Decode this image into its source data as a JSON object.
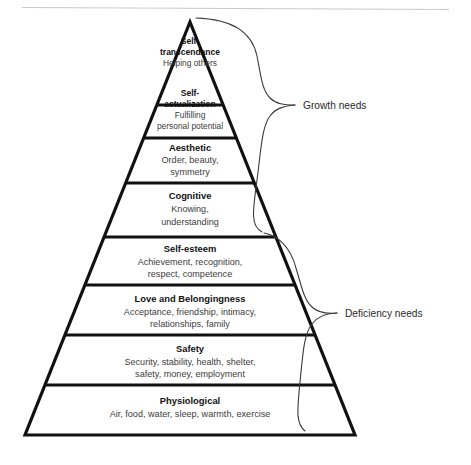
{
  "diagram": {
    "type": "pyramid-hierarchy",
    "background_color": "#ffffff",
    "line_color": "#111111",
    "brace_color": "#3a3a3a",
    "rule_color": "#c9c9c9",
    "tiers": [
      {
        "id": "self-transcendance",
        "title": "Self-",
        "title2": "transcendance",
        "description_line1": "Helping others",
        "description_line2": "",
        "group": "growth"
      },
      {
        "id": "self-actualization",
        "title": "Self-",
        "title2": "actualization",
        "description_line1": "Fulfilling",
        "description_line2": "personal potential",
        "group": "growth"
      },
      {
        "id": "aesthetic",
        "title": "Aesthetic",
        "title2": "",
        "description_line1": "Order, beauty,",
        "description_line2": "symmetry",
        "group": "growth"
      },
      {
        "id": "cognitive",
        "title": "Cognitive",
        "title2": "",
        "description_line1": "Knowing,",
        "description_line2": "understanding",
        "group": "growth"
      },
      {
        "id": "self-esteem",
        "title": "Self-esteem",
        "title2": "",
        "description_line1": "Achievement, recognition,",
        "description_line2": "respect, competence",
        "group": "deficiency"
      },
      {
        "id": "love-and-belongingness",
        "title": "Love and Belongingness",
        "title2": "",
        "description_line1": "Acceptance, friendship, intimacy,",
        "description_line2": "relationships, family",
        "group": "deficiency"
      },
      {
        "id": "safety",
        "title": "Safety",
        "title2": "",
        "description_line1": "Security, stability, health, shelter,",
        "description_line2": "safety, money, employment",
        "group": "deficiency"
      },
      {
        "id": "physiological",
        "title": "Physiological",
        "title2": "",
        "description_line1": "Air, food, water, sleep, warmth, exercise",
        "description_line2": "",
        "group": "deficiency"
      }
    ],
    "braces": [
      {
        "id": "growth",
        "label": "Growth needs"
      },
      {
        "id": "deficiency",
        "label": "Deficiency needs"
      }
    ]
  }
}
